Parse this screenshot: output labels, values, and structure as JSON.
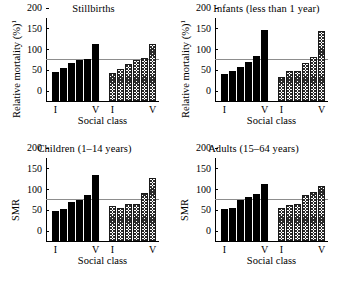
{
  "figure": {
    "background_color": "#ffffff",
    "reference_line_value": 100,
    "reference_line_color": "#8d8d8d",
    "male_series_color": "#000000",
    "female_series_fill": "checkered"
  },
  "axis": {
    "y_ticks": [
      "0",
      "50",
      "100",
      "150",
      "200"
    ],
    "y_min": 0,
    "y_max": 200,
    "x_label": "Social class",
    "x_tick_first": "I",
    "x_tick_last": "V",
    "y_label_mortality": "Relative mortality (%)",
    "y_label_mortality_superscript": "1",
    "y_label_smr": "SMR"
  },
  "chart_data": [
    {
      "type": "bar",
      "title": "Stillbirths",
      "xlabel": "Social class",
      "ylabel": "Relative mortality (%)",
      "ylim": [
        0,
        200
      ],
      "yticks": [
        0,
        50,
        100,
        150,
        200
      ],
      "grid": false,
      "reference_line": 100,
      "categories": [
        "I",
        "II",
        "III",
        "IV",
        "IVb",
        "V"
      ],
      "series": [
        {
          "name": "Males",
          "fill": "solid",
          "values": [
            69,
            80,
            91,
            100,
            101,
            138
          ]
        },
        {
          "name": "Females",
          "fill": "checkered",
          "values": [
            68,
            76,
            88,
            99,
            103,
            137
          ]
        }
      ]
    },
    {
      "type": "bar",
      "title": "Infants (less than 1 year)",
      "xlabel": "Social class",
      "ylabel": "Relative mortality (%)",
      "ylim": [
        0,
        200
      ],
      "yticks": [
        0,
        50,
        100,
        150,
        200
      ],
      "grid": false,
      "reference_line": 100,
      "categories": [
        "I",
        "II",
        "III",
        "IV",
        "IVb",
        "V"
      ],
      "series": [
        {
          "name": "Males",
          "fill": "solid",
          "values": [
            66,
            73,
            82,
            94,
            108,
            171
          ]
        },
        {
          "name": "Females",
          "fill": "checkered",
          "values": [
            58,
            73,
            73,
            92,
            105,
            168
          ]
        }
      ]
    },
    {
      "type": "bar",
      "title": "Children (1–14 years)",
      "xlabel": "Social class",
      "ylabel": "SMR",
      "ylim": [
        0,
        200
      ],
      "yticks": [
        0,
        50,
        100,
        150,
        200
      ],
      "grid": false,
      "reference_line": 100,
      "categories": [
        "I",
        "II",
        "III",
        "IV",
        "IVb",
        "V"
      ],
      "series": [
        {
          "name": "Males",
          "fill": "solid",
          "values": [
            72,
            77,
            93,
            98,
            110,
            160
          ]
        },
        {
          "name": "Females",
          "fill": "checkered",
          "values": [
            85,
            80,
            88,
            88,
            115,
            152
          ]
        }
      ]
    },
    {
      "type": "bar",
      "title": "Adults (15–64 years)",
      "xlabel": "Social class",
      "ylabel": "SMR",
      "ylim": [
        0,
        200
      ],
      "yticks": [
        0,
        50,
        100,
        150,
        200
      ],
      "grid": false,
      "reference_line": 100,
      "categories": [
        "I",
        "II",
        "III",
        "IV",
        "IVb",
        "V"
      ],
      "series": [
        {
          "name": "Males",
          "fill": "solid",
          "values": [
            77,
            80,
            100,
            105,
            113,
            137
          ]
        },
        {
          "name": "Females",
          "fill": "checkered",
          "values": [
            79,
            86,
            90,
            111,
            117,
            132
          ]
        }
      ]
    }
  ]
}
